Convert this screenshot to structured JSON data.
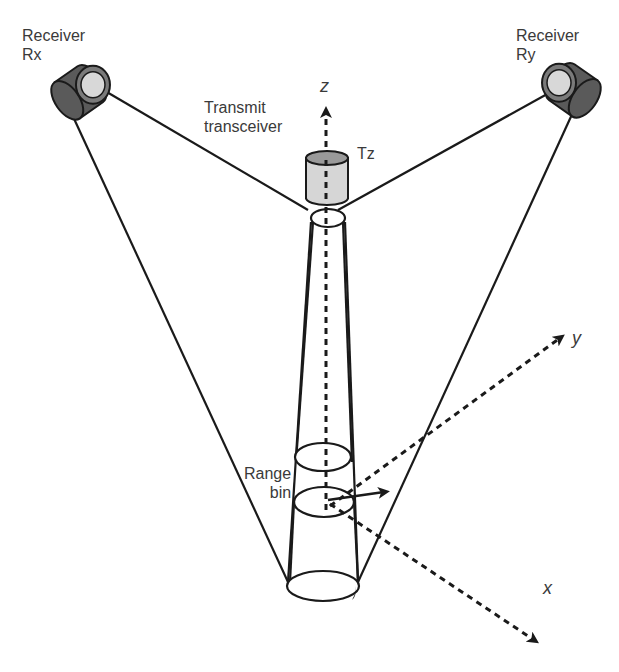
{
  "diagram": {
    "receivers": [
      {
        "id": "rx",
        "label_line1": "Receiver",
        "label_line2": "Rx"
      },
      {
        "id": "ry",
        "label_line1": "Receiver",
        "label_line2": "Ry"
      }
    ],
    "transmitter": {
      "label_line1": "Transmit",
      "label_line2": "transceiver",
      "tag": "Tz"
    },
    "range_bin": {
      "label_line1": "Range",
      "label_line2": "bin"
    },
    "axes": {
      "x": "x",
      "y": "y",
      "z": "z"
    },
    "colors": {
      "line": "#1a1a1a",
      "receiver_body": "#5a5a5a",
      "receiver_lens": "#d8d8d8",
      "transmitter_body": "#d6d6d6",
      "transmitter_top": "#9a9a9a",
      "text": "#3a3a3a"
    }
  }
}
